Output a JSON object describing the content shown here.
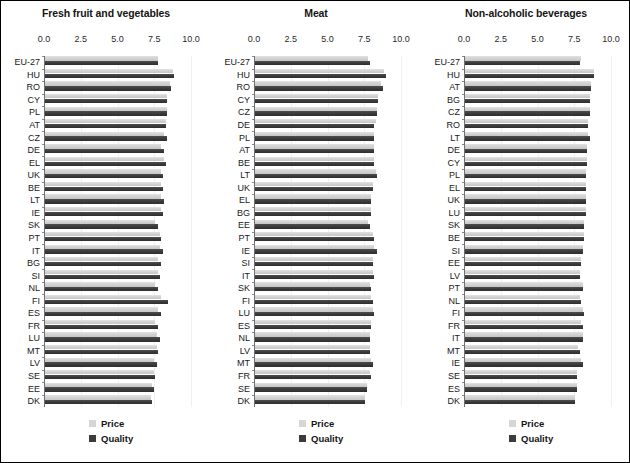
{
  "figure": {
    "legend": {
      "price_label": "Price",
      "quality_label": "Quality",
      "price_color": "#d6d6d6",
      "quality_color": "#3b3b3b"
    },
    "axis": {
      "ticks": [
        "0.0",
        "2.5",
        "5.0",
        "7.5",
        "10.0"
      ],
      "min": 0,
      "max": 10
    }
  },
  "chart_data": [
    {
      "type": "bar",
      "title": "Fresh fruit and vegetables",
      "orientation": "horizontal",
      "xlabel": "",
      "ylabel": "",
      "xlim": [
        0,
        10
      ],
      "xticks": [
        0.0,
        2.5,
        5.0,
        7.5,
        10.0
      ],
      "grid": false,
      "legend_position": "bottom",
      "categories": [
        "EU-27",
        "HU",
        "RO",
        "CY",
        "PL",
        "AT",
        "CZ",
        "DE",
        "EL",
        "UK",
        "BE",
        "LT",
        "IE",
        "SK",
        "PT",
        "IT",
        "BG",
        "SI",
        "NL",
        "FI",
        "ES",
        "FR",
        "LU",
        "MT",
        "LV",
        "SE",
        "EE",
        "DK"
      ],
      "series": [
        {
          "name": "Price",
          "values": [
            7.7,
            8.7,
            8.5,
            8.3,
            8.3,
            8.2,
            8.1,
            7.9,
            8.1,
            7.9,
            7.9,
            7.9,
            7.9,
            7.5,
            7.8,
            7.8,
            7.7,
            7.7,
            7.5,
            7.9,
            7.7,
            7.5,
            7.6,
            7.6,
            7.4,
            7.4,
            7.3,
            7.2
          ]
        },
        {
          "name": "Quality",
          "values": [
            7.7,
            8.8,
            8.6,
            8.3,
            8.3,
            8.2,
            8.3,
            8.1,
            8.2,
            8.0,
            8.0,
            8.1,
            8.0,
            7.7,
            7.9,
            8.0,
            7.9,
            7.8,
            7.7,
            8.4,
            7.9,
            7.7,
            7.8,
            7.7,
            7.6,
            7.5,
            7.4,
            7.3
          ]
        }
      ]
    },
    {
      "type": "bar",
      "title": "Meat",
      "orientation": "horizontal",
      "xlabel": "",
      "ylabel": "",
      "xlim": [
        0,
        10
      ],
      "xticks": [
        0.0,
        2.5,
        5.0,
        7.5,
        10.0
      ],
      "grid": false,
      "legend_position": "bottom",
      "categories": [
        "EU-27",
        "HU",
        "RO",
        "CY",
        "CZ",
        "DE",
        "PL",
        "AT",
        "BE",
        "LT",
        "UK",
        "EL",
        "BG",
        "EE",
        "PT",
        "IE",
        "SI",
        "IT",
        "SK",
        "FI",
        "LU",
        "ES",
        "NL",
        "LV",
        "MT",
        "FR",
        "SE",
        "DK"
      ],
      "series": [
        {
          "name": "Price",
          "values": [
            7.7,
            8.8,
            8.6,
            8.4,
            8.3,
            8.2,
            8.1,
            8.1,
            8.1,
            8.2,
            8.0,
            7.9,
            7.9,
            7.7,
            8.0,
            8.1,
            8.0,
            8.0,
            7.8,
            7.9,
            8.0,
            7.9,
            7.8,
            7.8,
            7.9,
            7.8,
            7.6,
            7.5
          ]
        },
        {
          "name": "Quality",
          "values": [
            7.8,
            8.9,
            8.7,
            8.4,
            8.3,
            8.1,
            8.1,
            8.1,
            8.1,
            8.3,
            8.0,
            7.9,
            7.9,
            7.8,
            8.1,
            8.3,
            8.0,
            8.1,
            7.9,
            8.0,
            8.1,
            7.9,
            7.8,
            7.8,
            8.0,
            7.9,
            7.6,
            7.5
          ]
        }
      ]
    },
    {
      "type": "bar",
      "title": "Non-alcoholic beverages",
      "orientation": "horizontal",
      "xlabel": "",
      "ylabel": "",
      "xlim": [
        0,
        10
      ],
      "xticks": [
        0.0,
        2.5,
        5.0,
        7.5,
        10.0
      ],
      "grid": false,
      "legend_position": "bottom",
      "categories": [
        "EU-27",
        "HU",
        "AT",
        "BG",
        "CZ",
        "RO",
        "LT",
        "DE",
        "CY",
        "PL",
        "EL",
        "UK",
        "LU",
        "SK",
        "BE",
        "SI",
        "EE",
        "LV",
        "PT",
        "NL",
        "FI",
        "FR",
        "IT",
        "MT",
        "IE",
        "SE",
        "ES",
        "DK"
      ],
      "series": [
        {
          "name": "Price",
          "values": [
            7.9,
            8.8,
            8.6,
            8.5,
            8.5,
            8.4,
            8.4,
            8.3,
            8.3,
            8.2,
            8.2,
            8.2,
            8.2,
            8.1,
            8.1,
            8.0,
            7.9,
            7.8,
            8.0,
            7.8,
            8.0,
            7.9,
            8.0,
            7.7,
            7.9,
            7.6,
            7.6,
            7.5
          ]
        },
        {
          "name": "Quality",
          "values": [
            7.8,
            8.8,
            8.6,
            8.5,
            8.5,
            8.4,
            8.5,
            8.3,
            8.3,
            8.2,
            8.2,
            8.2,
            8.2,
            8.1,
            8.1,
            8.0,
            7.9,
            7.8,
            8.0,
            7.9,
            8.1,
            8.0,
            8.0,
            7.8,
            8.0,
            7.6,
            7.6,
            7.5
          ]
        }
      ]
    }
  ]
}
